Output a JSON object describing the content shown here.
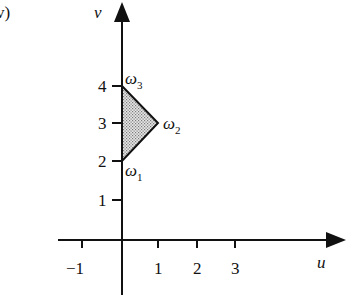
{
  "panel_label": "v)",
  "axes": {
    "x_label": "u",
    "y_label": "v",
    "x_ticks": [
      "−1",
      "1",
      "2",
      "3"
    ],
    "y_ticks": [
      "1",
      "2",
      "3",
      "4"
    ]
  },
  "region": {
    "shape": "triangle",
    "fill": "dotted-gray",
    "vertices": [
      {
        "name": "ω",
        "sub": "1",
        "u": 0,
        "v": 2
      },
      {
        "name": "ω",
        "sub": "2",
        "u": 1,
        "v": 3
      },
      {
        "name": "ω",
        "sub": "3",
        "u": 0,
        "v": 4
      }
    ]
  },
  "colors": {
    "stroke": "#111111",
    "fill": "#c8c8c8"
  }
}
